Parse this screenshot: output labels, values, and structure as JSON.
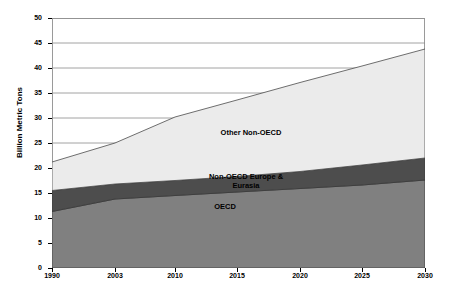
{
  "chart_data": {
    "type": "area",
    "title": "",
    "xlabel": "",
    "ylabel": "Billion Metric Tons",
    "ylim": [
      0,
      50
    ],
    "ytick_step": 5,
    "yticks": [
      "0",
      "5",
      "10",
      "15",
      "20",
      "25",
      "30",
      "35",
      "40",
      "45",
      "50"
    ],
    "categories": [
      "1990",
      "2003",
      "2010",
      "2015",
      "2020",
      "2025",
      "2030"
    ],
    "x": [
      1990,
      2003,
      2010,
      2015,
      2020,
      2025,
      2030
    ],
    "stacked": true,
    "grid": "horizontal",
    "legend": "inline-area-labels",
    "series": [
      {
        "name": "OECD",
        "color": "#808080",
        "values": [
          11.3,
          13.8,
          14.5,
          15.2,
          15.9,
          16.6,
          17.6
        ]
      },
      {
        "name": "Non-OECD Europe & Eurasia",
        "color": "#4d4d4d",
        "values": [
          4.2,
          3.0,
          3.0,
          3.1,
          3.4,
          4.0,
          4.4
        ]
      },
      {
        "name": "Other Non-OECD",
        "color": "#ebebeb",
        "values": [
          5.7,
          8.2,
          12.7,
          15.3,
          17.8,
          19.8,
          21.8
        ]
      }
    ],
    "cumulative": {
      "oecd_top": [
        11.3,
        13.8,
        14.5,
        15.2,
        15.9,
        16.6,
        17.6
      ],
      "euro_top": [
        15.5,
        16.8,
        17.5,
        18.3,
        19.3,
        20.6,
        22.0
      ],
      "total_top": [
        21.2,
        25.0,
        30.2,
        33.6,
        37.1,
        40.4,
        43.8
      ]
    },
    "area_labels": [
      {
        "text": "Other Non-OECD",
        "series": "Other Non-OECD"
      },
      {
        "text": "Non-OECD Europe & Eurasia",
        "series": "Non-OECD Europe & Eurasia"
      },
      {
        "text": "OECD",
        "series": "OECD"
      }
    ]
  },
  "axes": {
    "y_axis_title": "Billion Metric Tons",
    "y_ticks": [
      "50",
      "45",
      "40",
      "35",
      "30",
      "25",
      "20",
      "15",
      "10",
      "5",
      "0"
    ],
    "x_ticks": [
      "1990",
      "2003",
      "2010",
      "2015",
      "2020",
      "2025",
      "2030"
    ]
  },
  "labels": {
    "other_non_oecd": "Other Non-OECD",
    "non_oecd_europe_eurasia_line1": "Non-OECD Europe &",
    "non_oecd_europe_eurasia_line2": "Eurasia",
    "oecd": "OECD"
  },
  "colors": {
    "oecd": "#808080",
    "non_oecd_europe_eurasia": "#4d4d4d",
    "other_non_oecd": "#ebebeb",
    "gridline": "#8c8c8c",
    "border": "#9a9a9a",
    "text": "#000000",
    "background": "#ffffff"
  }
}
